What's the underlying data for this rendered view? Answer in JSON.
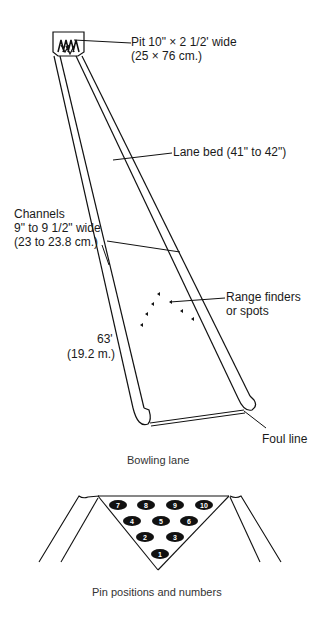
{
  "figure": {
    "labels": {
      "pit_line1": "Pit 10\" × 2 1/2' wide",
      "pit_line2": "(25 × 76 cm.)",
      "lane_bed": "Lane bed (41\" to 42\")",
      "channels_line1": "Channels",
      "channels_line2": "9\" to 9 1/2\" wide",
      "channels_line3": "(23 to 23.8 cm.)",
      "range_line1": "Range finders",
      "range_line2": "or spots",
      "length_line1": "63'",
      "length_line2": "(19.2 m.)",
      "foul_line": "Foul line"
    },
    "caption_lane": "Bowling lane",
    "caption_pins": "Pin positions and numbers",
    "pins": [
      {
        "n": "7",
        "x": 88,
        "y": 505
      },
      {
        "n": "8",
        "x": 120,
        "y": 505
      },
      {
        "n": "9",
        "x": 152,
        "y": 505
      },
      {
        "n": "10",
        "x": 203,
        "y": 505
      },
      {
        "n": "4",
        "x": 100,
        "y": 522
      },
      {
        "n": "5",
        "x": 130,
        "y": 522
      },
      {
        "n": "6",
        "x": 160,
        "y": 522
      },
      {
        "n": "2",
        "x": 114,
        "y": 538
      },
      {
        "n": "3",
        "x": 148,
        "y": 538
      },
      {
        "n": "1",
        "x": 130,
        "y": 554
      }
    ],
    "colors": {
      "ink": "#111111",
      "background": "#ffffff"
    }
  }
}
